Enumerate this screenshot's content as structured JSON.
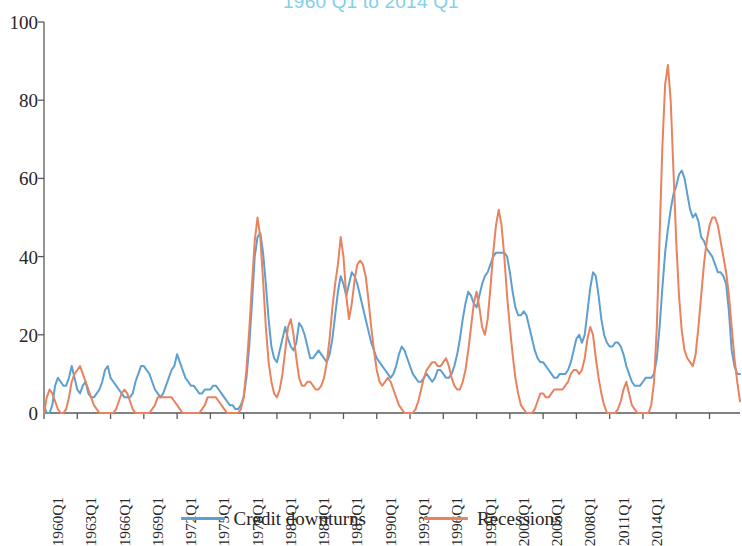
{
  "chart_data": {
    "type": "line",
    "title": "1960 Q1 to 2014 Q1",
    "xlabel": "",
    "ylabel": "",
    "ylim": [
      0,
      100
    ],
    "y_ticks": [
      0,
      20,
      40,
      60,
      80,
      100
    ],
    "grid": false,
    "legend_position": "bottom",
    "x_tick_labels": [
      "1960Q1",
      "1963Q1",
      "1966Q1",
      "1969Q1",
      "1972Q1",
      "1975Q1",
      "1978Q1",
      "1981Q1",
      "1984Q1",
      "1987Q1",
      "1990Q1",
      "1993Q1",
      "1996Q1",
      "1999Q1",
      "2002Q1",
      "2005Q1",
      "2008Q1",
      "2011Q1",
      "2014Q1"
    ],
    "x_start": "1960Q1",
    "x_end": "2014Q1",
    "x_step_quarters": 1,
    "x_tick_step_quarters": 12,
    "n_points": 217,
    "series": [
      {
        "name": "Credit downturns",
        "color": "#5c9fd0",
        "values": [
          2,
          0,
          0,
          2,
          7,
          9,
          8,
          7,
          7,
          9,
          12,
          9,
          6,
          5,
          7,
          8,
          5,
          4,
          4,
          5,
          6,
          8,
          11,
          12,
          9,
          8,
          7,
          6,
          5,
          4,
          4,
          4,
          5,
          8,
          10,
          12,
          12,
          11,
          10,
          8,
          6,
          5,
          4,
          5,
          7,
          9,
          11,
          12,
          15,
          13,
          11,
          9,
          8,
          7,
          7,
          6,
          5,
          5,
          6,
          6,
          6,
          7,
          7,
          6,
          5,
          4,
          3,
          2,
          2,
          1,
          1,
          2,
          4,
          9,
          17,
          28,
          40,
          45,
          46,
          41,
          33,
          24,
          17,
          14,
          13,
          16,
          19,
          22,
          19,
          17,
          16,
          18,
          23,
          22,
          20,
          17,
          14,
          14,
          15,
          16,
          15,
          14,
          13,
          15,
          19,
          25,
          31,
          35,
          33,
          30,
          33,
          36,
          35,
          33,
          30,
          27,
          24,
          21,
          18,
          16,
          14,
          13,
          12,
          11,
          10,
          9,
          10,
          12,
          15,
          17,
          16,
          14,
          12,
          10,
          9,
          8,
          8,
          9,
          10,
          9,
          8,
          9,
          11,
          11,
          10,
          9,
          9,
          10,
          12,
          15,
          19,
          24,
          28,
          31,
          30,
          28,
          27,
          30,
          33,
          35,
          36,
          38,
          40,
          41,
          41,
          41,
          41,
          40,
          36,
          31,
          27,
          25,
          25,
          26,
          25,
          22,
          19,
          16,
          14,
          13,
          13,
          12,
          11,
          10,
          9,
          9,
          10,
          10,
          10,
          11,
          13,
          16,
          19,
          20,
          18,
          20,
          26,
          32,
          36,
          35,
          30,
          24,
          20,
          18,
          17,
          17,
          18,
          18,
          17,
          15,
          12,
          10,
          8,
          7,
          7,
          7,
          8,
          9,
          9,
          9,
          10,
          14,
          22,
          32,
          41,
          47,
          52,
          56,
          58,
          61,
          62,
          60,
          56,
          52,
          50,
          51,
          49,
          45,
          44,
          42,
          41,
          40,
          38,
          36,
          36,
          35,
          33,
          26,
          16,
          12,
          10,
          10
        ]
      },
      {
        "name": "Recessions",
        "color": "#e8825f",
        "values": [
          0,
          4,
          6,
          5,
          3,
          1,
          0,
          0,
          1,
          4,
          8,
          10,
          11,
          12,
          10,
          8,
          6,
          4,
          2,
          1,
          0,
          0,
          0,
          0,
          0,
          0,
          1,
          3,
          5,
          6,
          5,
          3,
          1,
          0,
          0,
          0,
          0,
          0,
          0,
          1,
          2,
          4,
          4,
          4,
          4,
          4,
          4,
          3,
          2,
          1,
          0,
          0,
          0,
          0,
          0,
          0,
          0,
          1,
          2,
          4,
          4,
          4,
          4,
          3,
          2,
          1,
          0,
          0,
          0,
          0,
          0,
          1,
          4,
          11,
          21,
          33,
          44,
          50,
          45,
          34,
          22,
          13,
          8,
          5,
          4,
          6,
          10,
          16,
          22,
          24,
          20,
          14,
          9,
          7,
          7,
          8,
          8,
          7,
          6,
          6,
          7,
          9,
          13,
          19,
          27,
          33,
          38,
          45,
          40,
          30,
          24,
          28,
          34,
          38,
          39,
          38,
          35,
          29,
          22,
          16,
          11,
          8,
          7,
          8,
          9,
          8,
          6,
          4,
          2,
          1,
          0,
          0,
          0,
          0,
          1,
          3,
          6,
          9,
          11,
          12,
          13,
          13,
          12,
          12,
          13,
          14,
          12,
          9,
          7,
          6,
          6,
          8,
          11,
          16,
          22,
          28,
          31,
          27,
          22,
          20,
          24,
          32,
          41,
          48,
          52,
          48,
          40,
          30,
          22,
          15,
          9,
          5,
          2,
          1,
          0,
          0,
          0,
          1,
          3,
          5,
          5,
          4,
          4,
          5,
          6,
          6,
          6,
          6,
          7,
          8,
          10,
          11,
          11,
          10,
          11,
          14,
          19,
          22,
          20,
          14,
          9,
          5,
          2,
          0,
          0,
          0,
          0,
          1,
          3,
          6,
          8,
          5,
          2,
          1,
          0,
          0,
          0,
          0,
          0,
          2,
          8,
          22,
          45,
          68,
          84,
          89,
          80,
          62,
          44,
          30,
          21,
          16,
          14,
          13,
          12,
          15,
          22,
          30,
          38,
          44,
          48,
          50,
          50,
          48,
          44,
          40,
          36,
          30,
          22,
          14,
          8,
          3
        ]
      }
    ]
  },
  "legend": {
    "entries": [
      {
        "label": "Credit downturns",
        "color": "#5c9fd0"
      },
      {
        "label": "Recessions",
        "color": "#e8825f"
      }
    ]
  }
}
